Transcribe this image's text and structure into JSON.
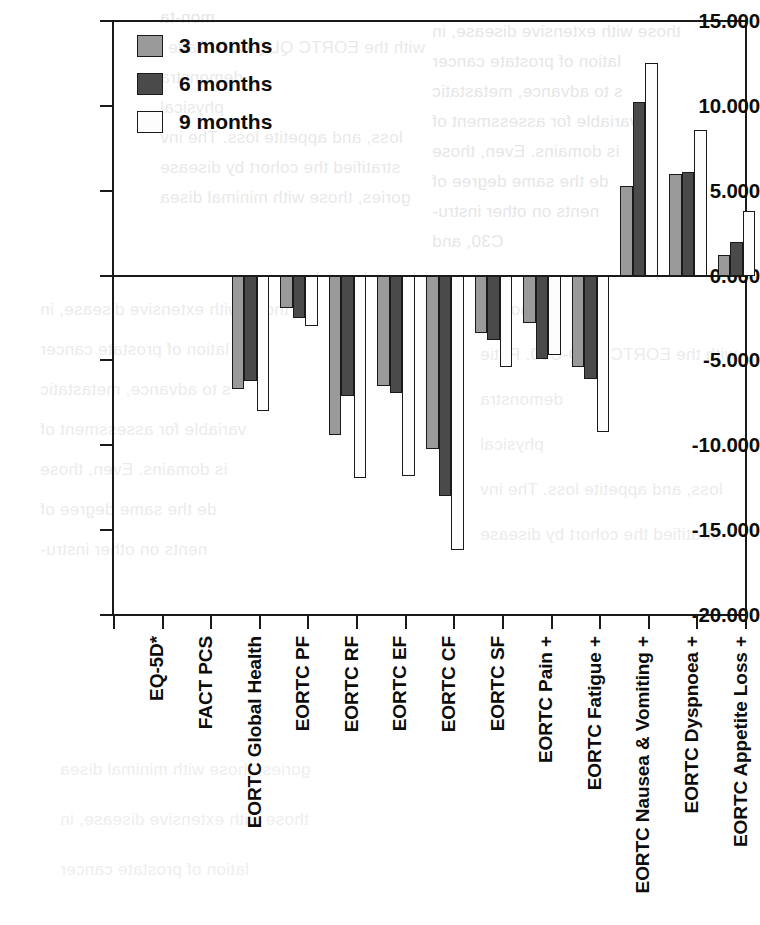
{
  "chart_data": {
    "type": "bar",
    "title": "",
    "subtitle": "",
    "xlabel": "",
    "ylabel": "",
    "ylim": [
      -20.0,
      15.0
    ],
    "yticks": [
      "15.000",
      "10.000",
      "5.000",
      "0.000",
      "-5.000",
      "-10.000",
      "-15.000",
      "-20.000"
    ],
    "ytick_values": [
      15.0,
      10.0,
      5.0,
      0.0,
      -5.0,
      -10.0,
      -15.0,
      -20.0
    ],
    "grid": false,
    "legend_position": "top-left",
    "orientation": "vertical",
    "categories": [
      "EQ-5D*",
      "FACT PCS",
      "EORTC Global Health",
      "EORTC PF",
      "EORTC RF",
      "EORTC EF",
      "EORTC CF",
      "EORTC SF",
      "EORTC Pain +",
      "EORTC Fatigue +",
      "EORTC Nausea & Vomiting +",
      "EORTC Dyspnoea +",
      "EORTC Appetite Loss +"
    ],
    "series": [
      {
        "name": "3 months",
        "color": "#9a9a9a",
        "values": [
          -6.7,
          -1.9,
          -9.4,
          -6.5,
          -10.2,
          -3.4,
          -2.8,
          -5.4,
          5.3,
          6.0,
          1.2,
          3.9,
          6.5
        ]
      },
      {
        "name": "6 months",
        "color": "#4a4a4a",
        "values": [
          -6.2,
          -2.5,
          -7.1,
          -6.9,
          -13.0,
          -3.8,
          -4.9,
          -6.1,
          10.2,
          6.1,
          2.0,
          3.6,
          4.9
        ]
      },
      {
        "name": "9 months",
        "color": "#fdfdfd",
        "values": [
          -8.0,
          -3.0,
          -11.9,
          -11.8,
          -16.2,
          -5.4,
          -4.7,
          -9.2,
          12.5,
          8.6,
          3.8,
          9.8,
          10.9
        ]
      }
    ]
  },
  "legend": {
    "items": [
      {
        "label": "3 months",
        "swatch": "s0"
      },
      {
        "label": "6 months",
        "swatch": "s1"
      },
      {
        "label": "9 months",
        "swatch": "s2"
      }
    ]
  },
  "background_text": {
    "note": "faint show-through text from the reverse of the printed page",
    "lines": [
      "mon-ta",
      "with the EORTC QLQ-C30. Patie",
      "demonstra",
      "physical",
      "loss, and appetite loss. The inv",
      "stratified the cohort by disease",
      "gories, those with minimal disea",
      "those with extensive disease, in",
      "lation of prostate cancer",
      "s to advance, metastatic",
      "variable for assessment of",
      "is domains. Even, those",
      "de the same degree of",
      "nents on other instru-",
      "C30, and",
      "ar, these"
    ]
  }
}
